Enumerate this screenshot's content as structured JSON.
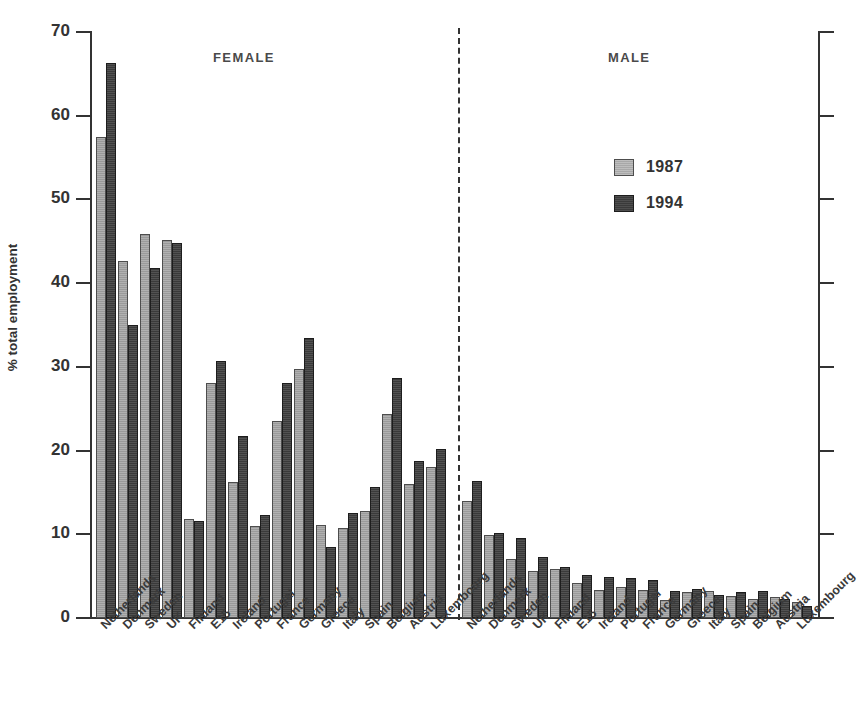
{
  "chart_data": {
    "type": "bar",
    "title": "",
    "xlabel": "",
    "ylabel": "% total employment",
    "ylim": [
      0,
      70
    ],
    "ytick_labels": [
      "0",
      "10",
      "20",
      "30",
      "40",
      "50",
      "60",
      "70"
    ],
    "ytick_values": [
      0,
      10,
      20,
      30,
      40,
      50,
      60,
      70
    ],
    "grid": false,
    "legend_position": "upper-right-inside",
    "legend": [
      "1987",
      "1994"
    ],
    "group_labels": [
      "FEMALE",
      "MALE"
    ],
    "categories": [
      "Netherlands",
      "Denmark",
      "Sweden",
      "UK",
      "Finland",
      "E15",
      "Ireland",
      "Portugal",
      "France",
      "Germany",
      "Greece",
      "Italy",
      "Spain",
      "Belgium",
      "Austria",
      "Luxembourg"
    ],
    "groups": [
      {
        "name": "FEMALE",
        "categories": [
          "Netherlands",
          "Denmark",
          "Sweden",
          "UK",
          "Finland",
          "E15",
          "Ireland",
          "Portugal",
          "France",
          "Germany",
          "Greece",
          "Italy",
          "Spain",
          "Belgium",
          "Austria",
          "Luxembourg"
        ],
        "series": [
          {
            "name": "1987",
            "values": [
              57.4,
              42.6,
              45.9,
              45.2,
              11.8,
              28.1,
              16.3,
              11.0,
              23.5,
              29.8,
              11.1,
              10.7,
              12.8,
              24.4,
              16.0,
              18.0
            ]
          },
          {
            "name": "1994",
            "values": [
              66.3,
              35.0,
              41.8,
              44.8,
              11.6,
              30.7,
              21.8,
              12.3,
              28.1,
              33.5,
              8.5,
              12.6,
              15.6,
              28.7,
              18.7,
              20.2
            ]
          }
        ]
      },
      {
        "name": "MALE",
        "categories": [
          "Netherlands",
          "Denmark",
          "Sweden",
          "UK",
          "Finland",
          "E15",
          "Ireland",
          "Portugal",
          "France",
          "Germany",
          "Greece",
          "Italy",
          "Spain",
          "Belgium",
          "Austria",
          "Luxembourg"
        ],
        "series": [
          {
            "name": "1987",
            "values": [
              14.0,
              9.9,
              7.0,
              5.6,
              5.9,
              4.2,
              3.4,
              3.7,
              3.4,
              2.2,
              3.1,
              3.2,
              2.6,
              2.3,
              2.5,
              1.9
            ]
          },
          {
            "name": "1994",
            "values": [
              16.4,
              10.2,
              9.6,
              7.3,
              6.1,
              5.1,
              4.9,
              4.8,
              4.5,
              3.2,
              3.5,
              2.8,
              3.1,
              3.2,
              2.3,
              1.4
            ]
          }
        ]
      }
    ],
    "colors": {
      "series_1987": "#9a9a9a",
      "series_1994": "#3a3a3a",
      "axis": "#333333",
      "background": "#ffffff"
    }
  }
}
